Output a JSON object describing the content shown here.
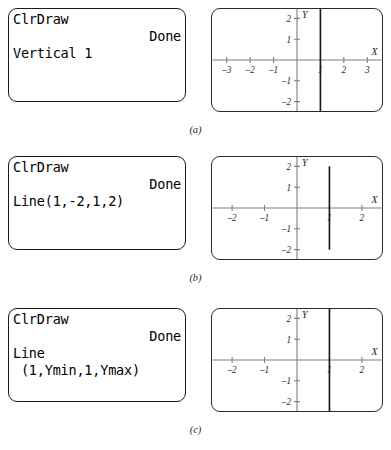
{
  "figure": {
    "panels": [
      {
        "id": "a",
        "caption": "(a)",
        "calculator": {
          "lines": [
            {
              "text": "ClrDraw",
              "align": "left"
            },
            {
              "text": "Done",
              "align": "right"
            },
            {
              "text": "Vertical 1",
              "align": "left"
            }
          ]
        },
        "graph": {
          "x_axis_label": "X",
          "y_axis_label": "Y",
          "x_ticks": [
            "-3",
            "-2",
            "-1",
            "1",
            "2",
            "3"
          ],
          "x_tick_values": [
            -3,
            -2,
            -1,
            1,
            2,
            3
          ],
          "y_ticks": [
            "2",
            "1",
            "-1",
            "-2"
          ],
          "y_tick_values": [
            2,
            1,
            -1,
            -2
          ],
          "xlim": [
            -3.6,
            3.6
          ],
          "ylim": [
            -2.45,
            2.45
          ],
          "drawn_line": {
            "type": "vertical",
            "x": 1,
            "extent": "full-screen",
            "y_start": -2.45,
            "y_end": 2.45
          }
        }
      },
      {
        "id": "b",
        "caption": "(b)",
        "calculator": {
          "lines": [
            {
              "text": "ClrDraw",
              "align": "left"
            },
            {
              "text": "Done",
              "align": "right"
            },
            {
              "text": "Line(1,-2,1,2)",
              "align": "left"
            }
          ]
        },
        "graph": {
          "x_axis_label": "X",
          "y_axis_label": "Y",
          "x_ticks": [
            "-2",
            "-1",
            "1",
            "2"
          ],
          "x_tick_values": [
            -2,
            -1,
            1,
            2
          ],
          "y_ticks": [
            "2",
            "1",
            "-1",
            "-2"
          ],
          "y_tick_values": [
            2,
            1,
            -1,
            -2
          ],
          "xlim": [
            -2.6,
            2.6
          ],
          "ylim": [
            -2.45,
            2.45
          ],
          "drawn_line": {
            "type": "segment",
            "x": 1,
            "extent": "y=-2 to y=2",
            "y_start": -2,
            "y_end": 2
          }
        }
      },
      {
        "id": "c",
        "caption": "(c)",
        "calculator": {
          "lines": [
            {
              "text": "ClrDraw",
              "align": "left"
            },
            {
              "text": "Done",
              "align": "right"
            },
            {
              "text": "Line",
              "align": "left"
            },
            {
              "text": " (1,Ymin,1,Ymax)",
              "align": "left"
            }
          ]
        },
        "graph": {
          "x_axis_label": "X",
          "y_axis_label": "Y",
          "x_ticks": [
            "-2",
            "-1",
            "1",
            "2"
          ],
          "x_tick_values": [
            -2,
            -1,
            1,
            2
          ],
          "y_ticks": [
            "2",
            "1",
            "-1",
            "-2"
          ],
          "y_tick_values": [
            2,
            1,
            -1,
            -2
          ],
          "xlim": [
            -2.6,
            2.6
          ],
          "ylim": [
            -2.45,
            2.45
          ],
          "drawn_line": {
            "type": "vertical",
            "x": 1,
            "extent": "full-screen",
            "y_start": -2.45,
            "y_end": 2.45
          }
        }
      }
    ]
  },
  "colors": {
    "ink": "#1a1a1a",
    "axis": "#7d7d7d",
    "frame": "#2b2b2b",
    "background": "#ffffff"
  }
}
